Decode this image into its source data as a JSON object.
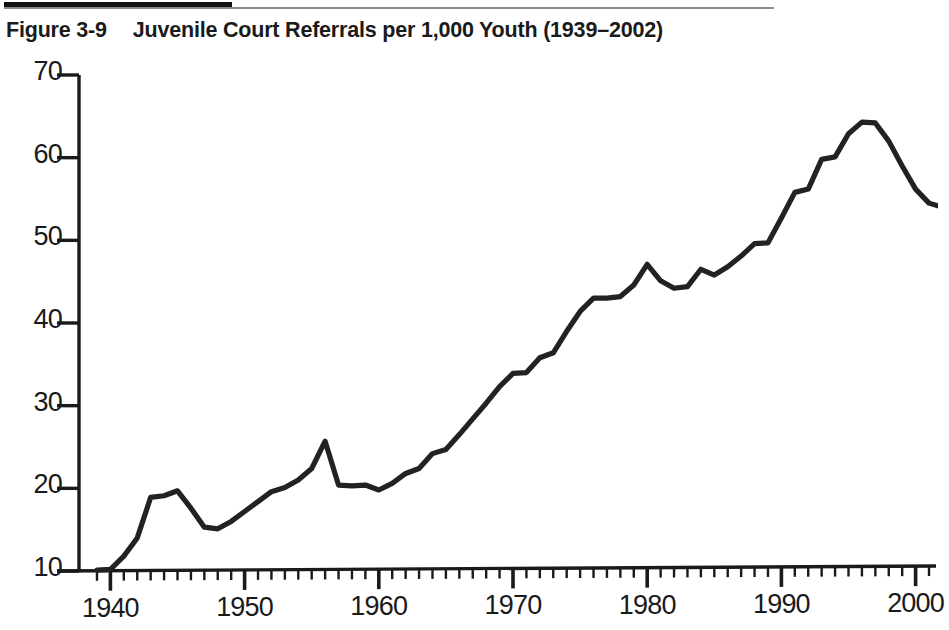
{
  "figure": {
    "label": "Figure 3-9",
    "caption": "Juvenile Court Referrals per 1,000 Youth (1939–2002)"
  },
  "chart_data": {
    "type": "line",
    "title": "Juvenile Court Referrals per 1,000 Youth (1939–2002)",
    "xlabel": "",
    "ylabel": "",
    "xlim": [
      1938.5,
      2002.5
    ],
    "ylim": [
      10,
      70
    ],
    "grid": false,
    "legend": null,
    "line_color": "#222222",
    "x_ticks": [
      1940,
      1950,
      1960,
      1970,
      1980,
      1990,
      2000
    ],
    "x_tick_labels": [
      "1940",
      "1950",
      "1960",
      "1970",
      "1980",
      "1990",
      "2000"
    ],
    "x_minor_tick_step": 1,
    "y_ticks": [
      10,
      20,
      30,
      40,
      50,
      60,
      70
    ],
    "y_tick_labels": [
      "10",
      "20",
      "30",
      "40",
      "50",
      "60",
      "70"
    ],
    "x": [
      1939,
      1940,
      1941,
      1942,
      1943,
      1944,
      1945,
      1946,
      1947,
      1948,
      1949,
      1950,
      1951,
      1952,
      1953,
      1954,
      1955,
      1956,
      1957,
      1958,
      1959,
      1960,
      1961,
      1962,
      1963,
      1964,
      1965,
      1966,
      1967,
      1968,
      1969,
      1970,
      1971,
      1972,
      1973,
      1974,
      1975,
      1976,
      1977,
      1978,
      1979,
      1980,
      1981,
      1982,
      1983,
      1984,
      1985,
      1986,
      1987,
      1988,
      1989,
      1990,
      1991,
      1992,
      1993,
      1994,
      1995,
      1996,
      1997,
      1998,
      1999,
      2000,
      2001,
      2002
    ],
    "values": [
      10.1,
      10.2,
      11.8,
      14.0,
      18.9,
      19.1,
      19.7,
      17.6,
      15.3,
      15.1,
      16.0,
      17.2,
      18.4,
      19.6,
      20.1,
      21.0,
      22.4,
      25.7,
      20.4,
      20.3,
      20.4,
      19.8,
      20.6,
      21.8,
      22.4,
      24.2,
      24.7,
      26.5,
      28.4,
      30.3,
      32.3,
      33.9,
      34.0,
      35.8,
      36.4,
      39.0,
      41.4,
      43.0,
      43.0,
      43.2,
      44.6,
      47.1,
      45.1,
      44.2,
      44.4,
      46.5,
      45.8,
      46.8,
      48.1,
      49.6,
      49.7,
      52.7,
      55.8,
      56.2,
      59.8,
      60.1,
      62.9,
      64.3,
      64.2,
      62.0,
      59.0,
      56.2,
      54.5,
      54.0
    ]
  }
}
